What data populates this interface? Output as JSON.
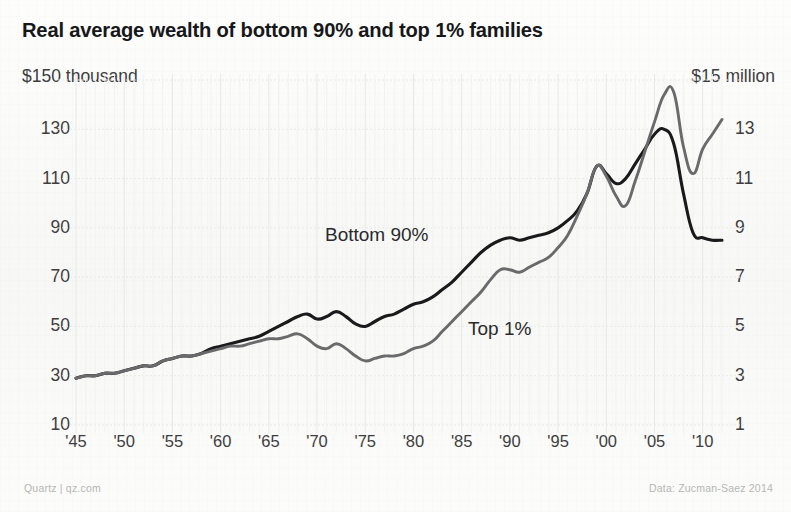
{
  "title": "Real average wealth of bottom 90% and top 1% families",
  "axes": {
    "left_unit": "$150 thousand",
    "right_unit": "$15 million",
    "left_ticks": [
      "130",
      "110",
      "90",
      "70",
      "50",
      "30",
      "10"
    ],
    "right_ticks": [
      "13",
      "11",
      "9",
      "7",
      "5",
      "3",
      "1"
    ],
    "x_ticks": [
      "'45",
      "'50",
      "'55",
      "'60",
      "'65",
      "'70",
      "'75",
      "'80",
      "'85",
      "'90",
      "'95",
      "'00",
      "'05",
      "'10"
    ]
  },
  "series_labels": {
    "bottom90": "Bottom 90%",
    "top1": "Top 1%"
  },
  "footer": {
    "source": "Quartz | qz.com",
    "data": "Data: Zucman-Saez 2014"
  },
  "colors": {
    "background": "#fbfbfa",
    "bottom90_line": "#1a1a1c",
    "top1_line": "#6a6a6c",
    "text": "#3d3d40",
    "gridline": "#e8e8e6",
    "footer_text": "#b6b6b4"
  },
  "chart_data": {
    "type": "line",
    "title": "Real average wealth of bottom 90% and top 1% families",
    "xlabel": "",
    "ylabel": "Average wealth",
    "grid": true,
    "legend": "inline-labels",
    "xlim": [
      1945,
      2012
    ],
    "y_left": {
      "label": "$ thousand (bottom 90%)",
      "lim": [
        10,
        150
      ],
      "ticks": [
        10,
        30,
        50,
        70,
        90,
        110,
        130,
        150
      ]
    },
    "y_right": {
      "label": "$ million (top 1%)",
      "lim": [
        1,
        15
      ],
      "ticks": [
        1,
        3,
        5,
        7,
        9,
        11,
        13,
        15
      ]
    },
    "x": [
      1945,
      1946,
      1947,
      1948,
      1949,
      1950,
      1951,
      1952,
      1953,
      1954,
      1955,
      1956,
      1957,
      1958,
      1959,
      1960,
      1961,
      1962,
      1963,
      1964,
      1965,
      1966,
      1967,
      1968,
      1969,
      1970,
      1971,
      1972,
      1973,
      1974,
      1975,
      1976,
      1977,
      1978,
      1979,
      1980,
      1981,
      1982,
      1983,
      1984,
      1985,
      1986,
      1987,
      1988,
      1989,
      1990,
      1991,
      1992,
      1993,
      1994,
      1995,
      1996,
      1997,
      1998,
      1999,
      2000,
      2001,
      2002,
      2003,
      2004,
      2005,
      2006,
      2007,
      2008,
      2009,
      2010,
      2011,
      2012
    ],
    "series": [
      {
        "name": "Bottom 90%",
        "unit": "$ thousand",
        "axis": "left",
        "color": "#1a1a1c",
        "values": [
          29,
          30,
          30,
          31,
          31,
          32,
          33,
          34,
          34,
          36,
          37,
          38,
          38,
          39,
          41,
          42,
          43,
          44,
          45,
          46,
          48,
          50,
          52,
          54,
          55,
          53,
          54,
          56,
          54,
          51,
          50,
          52,
          54,
          55,
          57,
          59,
          60,
          62,
          65,
          68,
          72,
          76,
          80,
          83,
          85,
          86,
          85,
          86,
          87,
          88,
          90,
          93,
          97,
          104,
          115,
          112,
          108,
          110,
          116,
          122,
          128,
          130,
          124,
          104,
          88,
          86,
          85,
          85
        ]
      },
      {
        "name": "Top 1%",
        "unit": "$ million",
        "axis": "right",
        "color": "#6a6a6c",
        "values": [
          2.9,
          3.0,
          3.0,
          3.1,
          3.1,
          3.2,
          3.3,
          3.4,
          3.4,
          3.6,
          3.7,
          3.8,
          3.8,
          3.9,
          4.0,
          4.1,
          4.2,
          4.2,
          4.3,
          4.4,
          4.5,
          4.5,
          4.6,
          4.7,
          4.5,
          4.2,
          4.1,
          4.3,
          4.1,
          3.8,
          3.6,
          3.7,
          3.8,
          3.8,
          3.9,
          4.1,
          4.2,
          4.4,
          4.8,
          5.2,
          5.6,
          6.0,
          6.4,
          6.9,
          7.3,
          7.3,
          7.2,
          7.4,
          7.6,
          7.8,
          8.2,
          8.7,
          9.5,
          10.4,
          11.5,
          11.1,
          10.3,
          9.9,
          10.9,
          12.1,
          13.3,
          14.4,
          14.5,
          12.3,
          11.2,
          12.2,
          12.8,
          13.4
        ]
      }
    ],
    "annotations": [
      {
        "text": "Bottom 90%",
        "x": 1966,
        "series": "Bottom 90%"
      },
      {
        "text": "Top 1%",
        "x": 1983,
        "series": "Top 1%"
      }
    ]
  }
}
